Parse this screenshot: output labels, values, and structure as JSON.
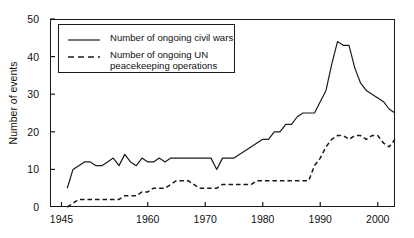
{
  "chart_data": {
    "type": "line",
    "title": "",
    "xlabel": "",
    "ylabel": "Number of events",
    "xlim": [
      1943,
      2003
    ],
    "ylim": [
      0,
      50
    ],
    "yticks": [
      0,
      10,
      20,
      30,
      40,
      50
    ],
    "xticks": [
      1945,
      1960,
      1970,
      1980,
      1990,
      2000
    ],
    "grid": false,
    "legend_position": "upper-left-inside",
    "series": [
      {
        "name": "Number of ongoing civil wars",
        "style": "solid",
        "color": "#1a1a1a",
        "x": [
          1946,
          1947,
          1948,
          1949,
          1950,
          1951,
          1952,
          1953,
          1954,
          1955,
          1956,
          1957,
          1958,
          1959,
          1960,
          1961,
          1962,
          1963,
          1964,
          1965,
          1966,
          1967,
          1968,
          1969,
          1970,
          1971,
          1972,
          1973,
          1974,
          1975,
          1976,
          1977,
          1978,
          1979,
          1980,
          1981,
          1982,
          1983,
          1984,
          1985,
          1986,
          1987,
          1988,
          1989,
          1990,
          1991,
          1992,
          1993,
          1994,
          1995,
          1996,
          1997,
          1998,
          1999,
          2000,
          2001,
          2002,
          2003
        ],
        "values": [
          5,
          10,
          11,
          12,
          12,
          11,
          11,
          12,
          13,
          11,
          14,
          12,
          11,
          13,
          12,
          12,
          13,
          12,
          13,
          13,
          13,
          13,
          13,
          13,
          13,
          13,
          10,
          13,
          13,
          13,
          14,
          15,
          16,
          17,
          18,
          18,
          20,
          20,
          22,
          22,
          24,
          25,
          25,
          25,
          28,
          31,
          38,
          44,
          43,
          43,
          37,
          33,
          31,
          30,
          29,
          28,
          26,
          25
        ]
      },
      {
        "name": "Number of ongoing UN peacekeeping operations",
        "style": "dashed",
        "color": "#1a1a1a",
        "x": [
          1946,
          1947,
          1948,
          1949,
          1950,
          1951,
          1952,
          1953,
          1954,
          1955,
          1956,
          1957,
          1958,
          1959,
          1960,
          1961,
          1962,
          1963,
          1964,
          1965,
          1966,
          1967,
          1968,
          1969,
          1970,
          1971,
          1972,
          1973,
          1974,
          1975,
          1976,
          1977,
          1978,
          1979,
          1980,
          1981,
          1982,
          1983,
          1984,
          1985,
          1986,
          1987,
          1988,
          1989,
          1990,
          1991,
          1992,
          1993,
          1994,
          1995,
          1996,
          1997,
          1998,
          1999,
          2000,
          2001,
          2002,
          2003
        ],
        "values": [
          0,
          1,
          2,
          2,
          2,
          2,
          2,
          2,
          2,
          2,
          3,
          3,
          3,
          4,
          4,
          5,
          5,
          5,
          6,
          7,
          7,
          7,
          6,
          5,
          5,
          5,
          5,
          6,
          6,
          6,
          6,
          6,
          6,
          7,
          7,
          7,
          7,
          7,
          7,
          7,
          7,
          7,
          7,
          11,
          13,
          16,
          18,
          19,
          19,
          18,
          19,
          19,
          18,
          19,
          19,
          17,
          16,
          18
        ]
      }
    ]
  },
  "legend": {
    "entries": [
      {
        "label": "Number of ongoing civil wars",
        "style": "solid"
      },
      {
        "label": "Number of ongoing UN\npeacekeeping operations",
        "style": "dashed"
      }
    ]
  },
  "axes": {
    "y_axis_label": "Number of events",
    "y_tick_labels": [
      "0",
      "10",
      "20",
      "30",
      "40",
      "50"
    ],
    "x_tick_labels": [
      "1945",
      "1960",
      "1970",
      "1980",
      "1990",
      "2000"
    ]
  }
}
